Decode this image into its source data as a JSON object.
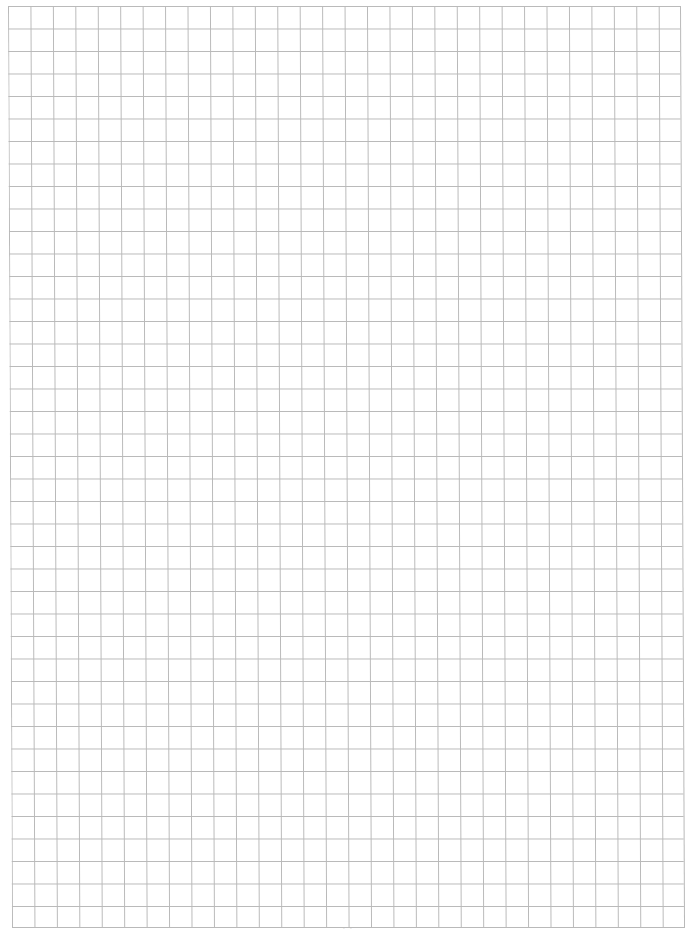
{
  "document": {
    "type": "grid-paper",
    "background_color": "#ffffff",
    "grid_line_color": "#b9b9b9",
    "grid": {
      "columns": 30,
      "rows": 41,
      "cell_size_px": 22.5
    },
    "footer_mark": "- -"
  }
}
